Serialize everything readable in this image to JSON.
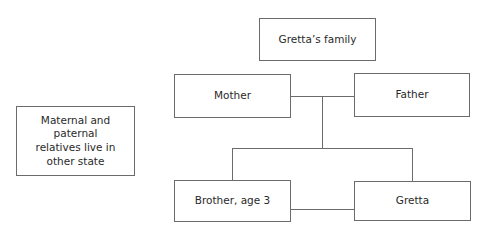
{
  "diagram": {
    "title": "Gretta’s family",
    "side_note": "Maternal and paternal relatives live in other state",
    "nodes": {
      "mother": "Mother",
      "father": "Father",
      "brother": "Brother, age 3",
      "gretta": "Gretta"
    },
    "edges": [
      [
        "mother",
        "father",
        "marriage"
      ],
      [
        "marriage",
        "brother",
        "child"
      ],
      [
        "marriage",
        "gretta",
        "child"
      ],
      [
        "brother",
        "gretta",
        "sibling"
      ]
    ]
  }
}
